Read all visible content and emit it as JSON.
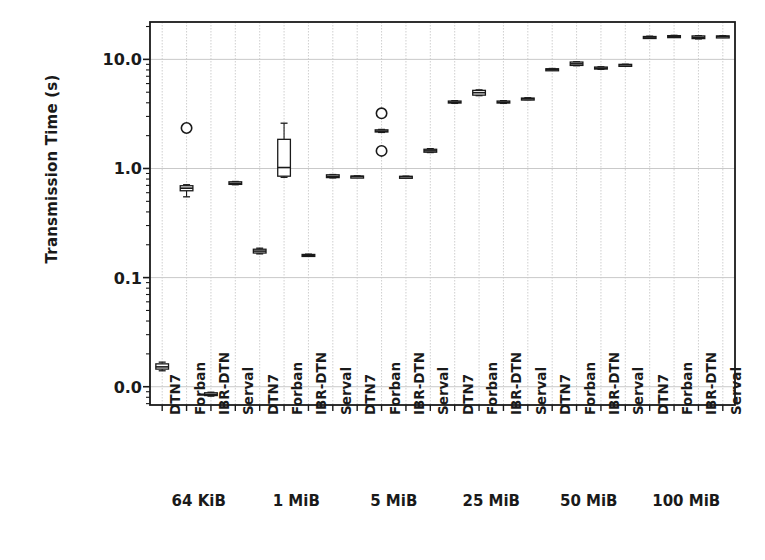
{
  "chart_data": {
    "type": "box",
    "title": "",
    "xlabel": "",
    "ylabel": "Transmission Time (s)",
    "yscale": "log",
    "ytick_labels": [
      "10.0",
      "1.0",
      "0.1",
      "0.0"
    ],
    "ytick_values": [
      10.0,
      1.0,
      0.1,
      0.01
    ],
    "ylim": [
      0.0068,
      22.0
    ],
    "grid": true,
    "legend": "none",
    "group_labels": [
      "64 KiB",
      "1 MiB",
      "5 MiB",
      "25 MiB",
      "50 MiB",
      "100 MiB"
    ],
    "protocols": [
      "DTN7",
      "Forban",
      "IBR-DTN",
      "Serval"
    ],
    "groups": [
      {
        "label": "64 KiB",
        "boxes": [
          {
            "protocol": "DTN7",
            "median": 0.0152,
            "q1": 0.0145,
            "q3": 0.0162,
            "low": 0.014,
            "high": 0.0168,
            "outliers": []
          },
          {
            "protocol": "Forban",
            "median": 0.66,
            "q1": 0.625,
            "q3": 0.695,
            "low": 0.55,
            "high": 0.71,
            "outliers": [
              2.35
            ]
          },
          {
            "protocol": "IBR-DTN",
            "median": 0.0085,
            "q1": 0.0083,
            "q3": 0.0088,
            "low": 0.0082,
            "high": 0.0089,
            "outliers": []
          },
          {
            "protocol": "Serval",
            "median": 0.73,
            "q1": 0.715,
            "q3": 0.755,
            "low": 0.71,
            "high": 0.76,
            "outliers": []
          }
        ]
      },
      {
        "label": "1 MiB",
        "boxes": [
          {
            "protocol": "DTN7",
            "median": 0.175,
            "q1": 0.168,
            "q3": 0.182,
            "low": 0.165,
            "high": 0.186,
            "outliers": []
          },
          {
            "protocol": "Forban",
            "median": 1.02,
            "q1": 0.85,
            "q3": 1.85,
            "low": 0.83,
            "high": 2.6,
            "outliers": []
          },
          {
            "protocol": "IBR-DTN",
            "median": 0.16,
            "q1": 0.158,
            "q3": 0.163,
            "low": 0.157,
            "high": 0.164,
            "outliers": []
          },
          {
            "protocol": "Serval",
            "median": 0.845,
            "q1": 0.825,
            "q3": 0.875,
            "low": 0.82,
            "high": 0.88,
            "outliers": []
          }
        ]
      },
      {
        "label": "5 MiB",
        "boxes": [
          {
            "protocol": "DTN7",
            "median": 0.845,
            "q1": 0.838,
            "q3": 0.852,
            "low": 0.835,
            "high": 0.855,
            "outliers": []
          },
          {
            "protocol": "Forban",
            "median": 2.2,
            "q1": 2.16,
            "q3": 2.26,
            "low": 2.14,
            "high": 2.28,
            "outliers": [
              3.2,
              1.45
            ]
          },
          {
            "protocol": "IBR-DTN",
            "median": 0.84,
            "q1": 0.835,
            "q3": 0.848,
            "low": 0.832,
            "high": 0.85,
            "outliers": []
          },
          {
            "protocol": "Serval",
            "median": 1.45,
            "q1": 1.41,
            "q3": 1.5,
            "low": 1.4,
            "high": 1.52,
            "outliers": []
          }
        ]
      },
      {
        "label": "25 MiB",
        "boxes": [
          {
            "protocol": "DTN7",
            "median": 4.05,
            "q1": 3.98,
            "q3": 4.15,
            "low": 3.95,
            "high": 4.18,
            "outliers": []
          },
          {
            "protocol": "Forban",
            "median": 4.95,
            "q1": 4.7,
            "q3": 5.2,
            "low": 4.65,
            "high": 5.25,
            "outliers": []
          },
          {
            "protocol": "IBR-DTN",
            "median": 4.05,
            "q1": 3.98,
            "q3": 4.15,
            "low": 3.95,
            "high": 4.18,
            "outliers": []
          },
          {
            "protocol": "Serval",
            "median": 4.35,
            "q1": 4.3,
            "q3": 4.42,
            "low": 4.28,
            "high": 4.45,
            "outliers": []
          }
        ]
      },
      {
        "label": "50 MiB",
        "boxes": [
          {
            "protocol": "DTN7",
            "median": 8.1,
            "q1": 8.02,
            "q3": 8.2,
            "low": 8.0,
            "high": 8.25,
            "outliers": []
          },
          {
            "protocol": "Forban",
            "median": 9.1,
            "q1": 8.8,
            "q3": 9.45,
            "low": 8.75,
            "high": 9.5,
            "outliers": []
          },
          {
            "protocol": "IBR-DTN",
            "median": 8.3,
            "q1": 8.15,
            "q3": 8.5,
            "low": 8.1,
            "high": 8.55,
            "outliers": []
          },
          {
            "protocol": "Serval",
            "median": 8.9,
            "q1": 8.82,
            "q3": 9.0,
            "low": 8.8,
            "high": 9.02,
            "outliers": []
          }
        ]
      },
      {
        "label": "100 MiB",
        "boxes": [
          {
            "protocol": "DTN7",
            "median": 16.0,
            "q1": 15.8,
            "q3": 16.2,
            "low": 15.7,
            "high": 16.3,
            "outliers": []
          },
          {
            "protocol": "Forban",
            "median": 16.3,
            "q1": 16.1,
            "q3": 16.5,
            "low": 16.0,
            "high": 16.6,
            "outliers": []
          },
          {
            "protocol": "IBR-DTN",
            "median": 15.9,
            "q1": 15.5,
            "q3": 16.4,
            "low": 15.4,
            "high": 16.5,
            "outliers": []
          },
          {
            "protocol": "Serval",
            "median": 16.2,
            "q1": 16.0,
            "q3": 16.4,
            "low": 15.9,
            "high": 16.5,
            "outliers": []
          }
        ]
      }
    ],
    "colors": {
      "line": "#1a1a1a",
      "grid": "#c9c9c9",
      "marker_face": "#ffffff",
      "background": "#ffffff"
    }
  }
}
